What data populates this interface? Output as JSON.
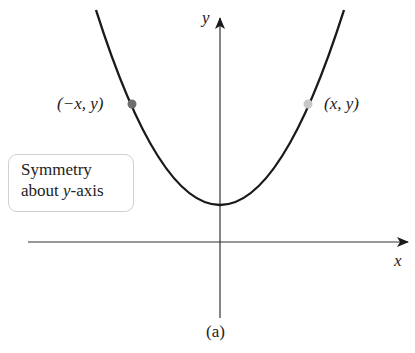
{
  "figure": {
    "caption": "(a)",
    "axes": {
      "x_label": "x",
      "y_label": "y"
    },
    "curve": {
      "type": "parabola",
      "description": "upward-opening parabola symmetric about y-axis, vertex above x-axis",
      "color": "#1a1a1a"
    },
    "points": [
      {
        "label": "(−x, y)",
        "color": "#6e6e6e"
      },
      {
        "label": "(x, y)",
        "color": "#c8c8c8"
      }
    ],
    "note_box": {
      "line1": "Symmetry",
      "line2_prefix": "about ",
      "line2_var": "y",
      "line2_suffix": "-axis"
    }
  }
}
